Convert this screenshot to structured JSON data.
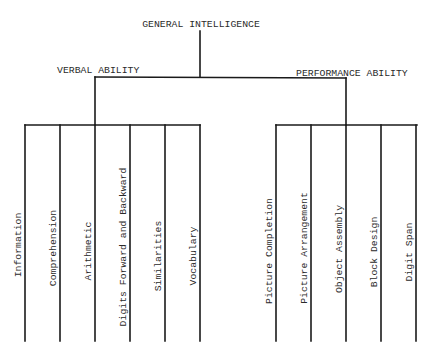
{
  "root": {
    "label": "GENERAL INTELLIGENCE"
  },
  "branches": [
    {
      "label": "VERBAL ABILITY",
      "children": [
        "Information",
        "Comprehension",
        "Arithmetic",
        "Digits Forward and Backward",
        "Similarities",
        "Vocabulary"
      ]
    },
    {
      "label": "PERFORMANCE ABILITY",
      "children": [
        "Picture Completion",
        "Picture Arrangement",
        "Object Assembly",
        "Block Design",
        "Digit Span"
      ]
    }
  ]
}
